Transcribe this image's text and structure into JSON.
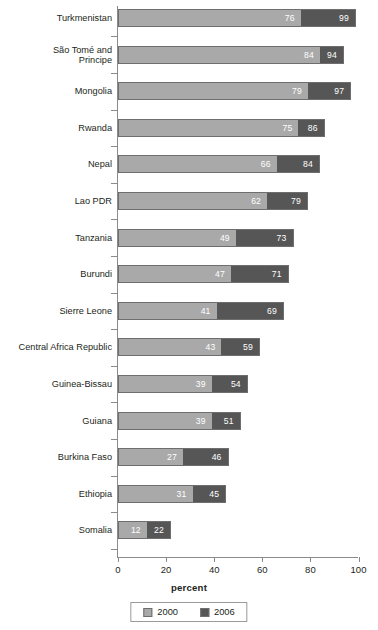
{
  "chart_data": {
    "type": "bar",
    "subtype": "horizontal-stacked-overlay",
    "title": "",
    "xlabel": "percent",
    "ylabel": "",
    "xlim": [
      0,
      100
    ],
    "xticks": [
      0,
      20,
      40,
      60,
      80,
      100
    ],
    "grid": false,
    "legend_position": "bottom-center",
    "categories": [
      "Turkmenistan",
      "São Tomé and\nPrincipe",
      "Mongolia",
      "Rwanda",
      "Nepal",
      "Lao PDR",
      "Tanzania",
      "Burundi",
      "Sierre Leone",
      "Central Africa Republic",
      "Guinea-Bissau",
      "Guiana",
      "Burkina Faso",
      "Ethiopia",
      "Somalia"
    ],
    "series": [
      {
        "name": "2000",
        "color": "#a9a9a9",
        "values": [
          76,
          84,
          79,
          75,
          66,
          62,
          49,
          47,
          41,
          43,
          39,
          39,
          27,
          31,
          12
        ]
      },
      {
        "name": "2006",
        "color": "#565656",
        "values": [
          99,
          94,
          97,
          86,
          84,
          79,
          73,
          71,
          69,
          59,
          54,
          51,
          46,
          45,
          22
        ]
      }
    ]
  },
  "axis": {
    "x_title": "percent",
    "tick_labels": [
      "0",
      "20",
      "40",
      "60",
      "80",
      "100"
    ]
  },
  "legend": {
    "items": [
      {
        "label": "2000",
        "color": "#a9a9a9"
      },
      {
        "label": "2006",
        "color": "#565656"
      }
    ]
  }
}
